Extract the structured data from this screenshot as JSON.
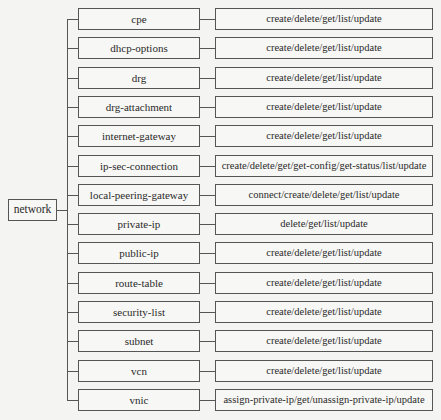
{
  "root": {
    "label": "network"
  },
  "layout": {
    "first_row_top": 8,
    "row_pitch": 29.3
  },
  "resources": [
    {
      "name": "cpe",
      "operations": "create/delete/get/list/update"
    },
    {
      "name": "dhcp-options",
      "operations": "create/delete/get/list/update"
    },
    {
      "name": "drg",
      "operations": "create/delete/get/list/update"
    },
    {
      "name": "drg-attachment",
      "operations": "create/delete/get/list/update"
    },
    {
      "name": "internet-gateway",
      "operations": "create/delete/get/list/update"
    },
    {
      "name": "ip-sec-connection",
      "operations": "create/delete/get/get-config/get-status/list/update"
    },
    {
      "name": "local-peering-gateway",
      "operations": "connect/create/delete/get/list/update"
    },
    {
      "name": "private-ip",
      "operations": "delete/get/list/update"
    },
    {
      "name": "public-ip",
      "operations": "create/delete/get/list/update"
    },
    {
      "name": "route-table",
      "operations": "create/delete/get/list/update"
    },
    {
      "name": "security-list",
      "operations": "create/delete/get/list/update"
    },
    {
      "name": "subnet",
      "operations": "create/delete/get/list/update"
    },
    {
      "name": "vcn",
      "operations": "create/delete/get/list/update"
    },
    {
      "name": "vnic",
      "operations": "assign-private-ip/get/unassign-private-ip/update"
    }
  ]
}
